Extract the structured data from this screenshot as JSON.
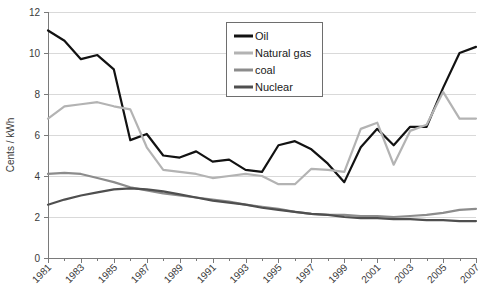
{
  "chart_data": {
    "type": "line",
    "title": "",
    "xlabel": "",
    "ylabel": "Cents / kWh",
    "ylim": [
      0,
      12
    ],
    "ytick_step": 2,
    "yticks": [
      "0",
      "2",
      "4",
      "6",
      "8",
      "10",
      "12"
    ],
    "xlim": [
      1981,
      2007
    ],
    "x": [
      1981,
      1982,
      1983,
      1984,
      1985,
      1986,
      1987,
      1988,
      1989,
      1990,
      1991,
      1992,
      1993,
      1994,
      1995,
      1996,
      1997,
      1998,
      1999,
      2000,
      2001,
      2002,
      2003,
      2004,
      2005,
      2006,
      2007
    ],
    "xticklabels": [
      "1981",
      "1983",
      "1985",
      "1987",
      "1989",
      "1991",
      "1993",
      "1995",
      "1997",
      "1999",
      "2001",
      "2003",
      "2005",
      "2007"
    ],
    "xtick_values": [
      1981,
      1983,
      1985,
      1987,
      1989,
      1991,
      1993,
      1995,
      1997,
      1999,
      2001,
      2003,
      2005,
      2007
    ],
    "xtick_rotation": -45,
    "grid": "horizontal",
    "legend_position": "top-center-right",
    "series": [
      {
        "name": "Oil",
        "color": "#121212",
        "values": [
          11.1,
          10.6,
          9.7,
          9.9,
          9.2,
          5.75,
          6.05,
          5.0,
          4.9,
          5.2,
          4.7,
          4.8,
          4.3,
          4.2,
          5.5,
          5.7,
          5.3,
          4.6,
          3.7,
          5.4,
          6.3,
          5.5,
          6.4,
          6.4,
          8.3,
          10.0,
          10.3
        ]
      },
      {
        "name": "Natural gas",
        "color": "#b3b3b3",
        "values": [
          6.8,
          7.4,
          7.5,
          7.6,
          7.4,
          7.25,
          5.4,
          4.3,
          4.2,
          4.1,
          3.9,
          4.0,
          4.1,
          4.0,
          3.6,
          3.6,
          4.35,
          4.3,
          4.2,
          6.3,
          6.6,
          4.55,
          6.2,
          6.5,
          8.1,
          6.8,
          6.8
        ]
      },
      {
        "name": "coal",
        "color": "#8c8c8c",
        "values": [
          4.1,
          4.15,
          4.1,
          3.9,
          3.7,
          3.45,
          3.3,
          3.15,
          3.05,
          2.95,
          2.85,
          2.75,
          2.6,
          2.5,
          2.4,
          2.25,
          2.15,
          2.1,
          2.1,
          2.05,
          2.05,
          2.0,
          2.05,
          2.1,
          2.2,
          2.35,
          2.4
        ]
      },
      {
        "name": "Nuclear",
        "color": "#4f4f4f",
        "values": [
          2.6,
          2.85,
          3.05,
          3.2,
          3.35,
          3.4,
          3.35,
          3.25,
          3.1,
          2.95,
          2.8,
          2.7,
          2.6,
          2.45,
          2.35,
          2.25,
          2.15,
          2.1,
          2.0,
          1.95,
          1.95,
          1.9,
          1.9,
          1.85,
          1.85,
          1.8,
          1.8
        ]
      }
    ]
  },
  "legend": {
    "items": [
      {
        "label": "Oil",
        "color": "#121212"
      },
      {
        "label": "Natural gas",
        "color": "#b3b3b3"
      },
      {
        "label": "coal",
        "color": "#8c8c8c"
      },
      {
        "label": "Nuclear",
        "color": "#4f4f4f"
      }
    ]
  },
  "axes": {
    "y_title": "Cents / kWh"
  }
}
